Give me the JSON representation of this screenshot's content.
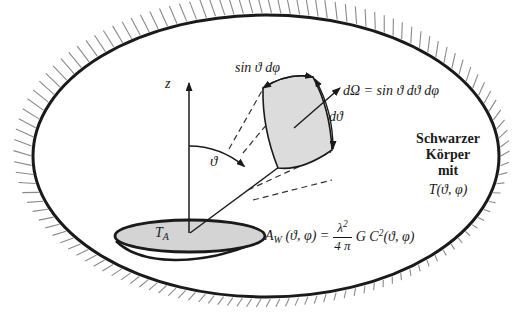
{
  "figure": {
    "type": "blackbody-cavity-antenna-diagram",
    "background": "#ffffff",
    "ink_color": "#1a1a1a",
    "hatch_color": "#8a8a8a",
    "patch_fill": "#dcdcdc",
    "dish_fill": "#d4d4d4"
  },
  "labels": {
    "z_axis": "z",
    "theta_angle": "ϑ",
    "patch_width": "sin ϑ dφ",
    "solid_angle": "dΩ = sin ϑ dϑ dφ",
    "patch_height": "dϑ",
    "antenna_temperature": {
      "base": "T",
      "sub": "A"
    },
    "blackbody": {
      "line1": "Schwarzer",
      "line2": "Körper",
      "line3": "mit",
      "temperature_fn": "T(ϑ, φ)"
    },
    "effective_area": {
      "lead_base": "A",
      "lead_sub": "W",
      "lead_rest": " (ϑ, φ) = ",
      "frac_num_base": "λ",
      "frac_num_exp": "2",
      "frac_den": "4 π",
      "tail_base": "G C",
      "tail_exp": "2",
      "tail_rest": "(ϑ, φ)"
    }
  }
}
